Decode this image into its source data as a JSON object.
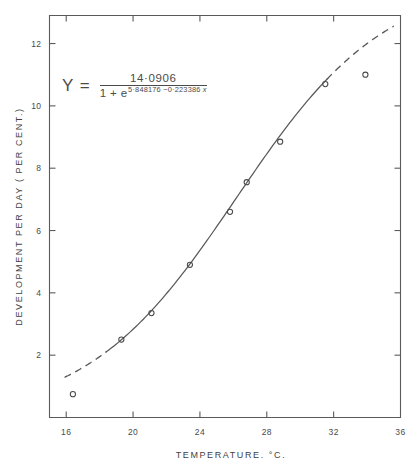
{
  "chart_data": {
    "type": "scatter",
    "title": "",
    "subtitle": "",
    "xlabel": "TEMPERATURE.  °C.",
    "ylabel": "DEVELOPMENT PER DAY  ( PER CENT.)",
    "xlim": [
      15,
      36
    ],
    "ylim": [
      0,
      12.9
    ],
    "xticks": [
      16,
      20,
      24,
      28,
      32,
      36
    ],
    "xticklabels": [
      "16",
      "20",
      "24",
      "28",
      "32",
      "36"
    ],
    "yticks": [
      2,
      4,
      6,
      8,
      10,
      12
    ],
    "yticklabels": [
      "2",
      "4",
      "6",
      "8",
      "10",
      "12"
    ],
    "grid": false,
    "legend": null,
    "series": [
      {
        "name": "observed",
        "marker": "open-circle",
        "x": [
          16.4,
          19.3,
          21.1,
          23.4,
          25.8,
          26.8,
          28.8,
          31.5,
          33.9
        ],
        "y": [
          0.75,
          2.5,
          3.35,
          4.9,
          6.6,
          7.55,
          8.85,
          10.7,
          11.0
        ]
      },
      {
        "name": "fitted logistic curve",
        "style": "solid",
        "x_range": [
          18.4,
          31.6
        ]
      },
      {
        "name": "fitted curve extrapolation",
        "style": "dashed",
        "x_range_low": [
          15.9,
          18.4
        ],
        "x_range_high": [
          31.6,
          35.6
        ]
      }
    ],
    "annotations": [
      {
        "name": "fitted-equation",
        "lhs": "Y  =",
        "numerator": "14·0906",
        "denominator_base": "1 + e",
        "denominator_exponent": "5·848176 − 0·223386 x",
        "x": 24.5,
        "y": 11.2
      }
    ],
    "model": {
      "form": "Y = L / (1 + e^(a - b*x))",
      "L": 14.0906,
      "a": 5.848176,
      "b": 0.223386
    }
  },
  "equation": {
    "lhs": "Y  =",
    "numerator": "14·0906",
    "denominator_base": "1 + e",
    "exponent_a": "5·848176",
    "exponent_minus": "−",
    "exponent_b": "0·223386",
    "exponent_var": "x"
  },
  "axes": {
    "x_title_main": "TEMPERATURE.",
    "x_title_unit_deg": "°",
    "x_title_unit": "C.",
    "y_title": "DEVELOPMENT PER DAY  ( PER CENT.)"
  }
}
